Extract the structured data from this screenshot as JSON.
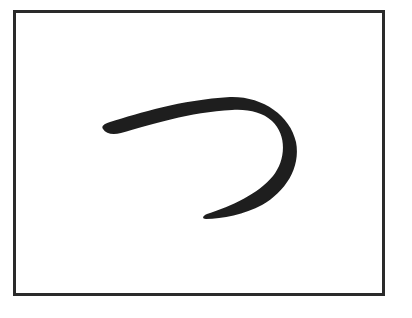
{
  "character": {
    "glyph": "つ",
    "script": "hiragana",
    "romanization": "tsu"
  },
  "colors": {
    "background": "#ffffff",
    "frame_border": "#2a2a2a",
    "stroke": "#1e1e1e"
  }
}
